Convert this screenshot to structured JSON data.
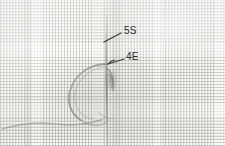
{
  "figure": {
    "name": "annotated-micrograph",
    "alt_description": "Grayscale photograph of a woven mesh fabric with a suture thread loop, annotated with two leader-line callouts",
    "background_description": "fine woven grid mesh fabric",
    "width_px": 225,
    "height_px": 146,
    "colors": {
      "background": "#fcfcfb",
      "mesh_line": "#87877f",
      "specimen": "#8e8e88",
      "annotation_text": "#2c2c2c",
      "leader_line": "#3a3a3a"
    }
  },
  "annotations": [
    {
      "id": "annotation-5s",
      "label": "5S",
      "text_x": 124,
      "text_y": 31,
      "leader": {
        "x1": 104,
        "y1": 42,
        "x2": 121,
        "y2": 33
      },
      "points_to": "upper vertical thread segment"
    },
    {
      "id": "annotation-4e",
      "label": "4E",
      "text_x": 126,
      "text_y": 57,
      "leader": {
        "x1": 108,
        "y1": 64,
        "x2": 124,
        "y2": 59
      },
      "points_to": "thread loop junction"
    }
  ],
  "specimen": {
    "name": "suture-thread-loop",
    "parts": [
      {
        "name": "vertical-thread",
        "description": "near-vertical thread running from top to bottom of frame"
      },
      {
        "name": "loop-arc",
        "description": "large rounded loop left of the vertical thread"
      },
      {
        "name": "thread-tail",
        "description": "thread tail curving out toward the lower-left edge"
      },
      {
        "name": "knot-shadow",
        "description": "dark cluster where loop meets vertical thread"
      }
    ]
  }
}
